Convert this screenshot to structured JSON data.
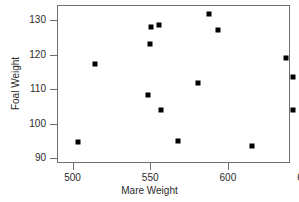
{
  "chart_data": {
    "type": "scatter",
    "title": "",
    "xlabel": "Mare Weight",
    "ylabel": "Foal Weight",
    "xlim": [
      490,
      640
    ],
    "ylim": [
      88.5,
      134.5
    ],
    "xticks": [
      500,
      550,
      600,
      650
    ],
    "yticks": [
      90,
      100,
      110,
      120,
      130
    ],
    "grid": false,
    "legend": null,
    "marker": "square",
    "marker_color": "#000000",
    "frame_color": "#6e6e6e",
    "points": [
      {
        "x": 503,
        "y": 95.0
      },
      {
        "x": 514,
        "y": 117.7
      },
      {
        "x": 548,
        "y": 108.5
      },
      {
        "x": 549,
        "y": 123.5
      },
      {
        "x": 550,
        "y": 128.3
      },
      {
        "x": 555,
        "y": 128.9
      },
      {
        "x": 556,
        "y": 104.2
      },
      {
        "x": 567,
        "y": 95.1
      },
      {
        "x": 580,
        "y": 112.2
      },
      {
        "x": 587,
        "y": 132.2
      },
      {
        "x": 593,
        "y": 127.6
      },
      {
        "x": 615,
        "y": 93.7
      },
      {
        "x": 637,
        "y": 119.4
      },
      {
        "x": 641,
        "y": 113.7
      },
      {
        "x": 641,
        "y": 104.2
      }
    ]
  }
}
